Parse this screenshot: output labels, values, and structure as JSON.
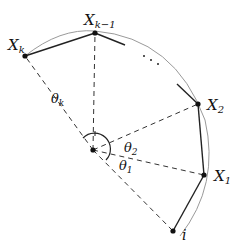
{
  "diagram": {
    "center": {
      "x": 93,
      "y": 150
    },
    "points": [
      {
        "id": "i",
        "x": 173,
        "y": 231,
        "label": "i"
      },
      {
        "id": "X1",
        "x": 204,
        "y": 175,
        "label": "X",
        "sub": "1"
      },
      {
        "id": "X2",
        "x": 198,
        "y": 104,
        "label": "X",
        "sub": "2"
      },
      {
        "id": "Xk-1",
        "x": 95,
        "y": 33,
        "label": "X",
        "sub": "k−1"
      },
      {
        "id": "Xk",
        "x": 25,
        "y": 56,
        "label": "X",
        "sub": "k"
      }
    ],
    "angles": [
      {
        "label": "θ",
        "sub": "k"
      },
      {
        "label": "θ",
        "sub": "2"
      },
      {
        "label": "θ",
        "sub": "1"
      }
    ],
    "ellipsis": "…",
    "colors": {
      "line": "#222222",
      "arc": "#9a9a9a",
      "dash": "#333333"
    }
  }
}
